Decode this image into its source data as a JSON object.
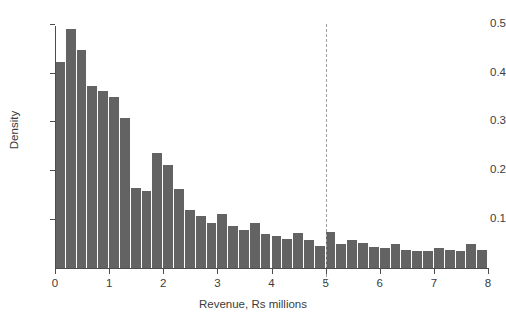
{
  "chart_data": {
    "type": "bar",
    "title": "",
    "subtitle": "",
    "xlabel": "Revenue, Rs millions",
    "ylabel": "Density",
    "xlim": [
      0,
      8
    ],
    "ylim": [
      0,
      0.52
    ],
    "bin_width": 0.2,
    "grid": false,
    "legend": null,
    "bar_color": "#636363",
    "axis_color": "#4d4d4d",
    "xticks": [
      0,
      1,
      2,
      3,
      4,
      5,
      6,
      7,
      8
    ],
    "xtick_labels": [
      "0",
      "1",
      "2",
      "3",
      "4",
      "5",
      "6",
      "7",
      "8"
    ],
    "yticks": [
      0.1,
      0.2,
      0.3,
      0.4,
      0.5
    ],
    "ytick_labels": [
      "0.1",
      "0.2",
      "0.3",
      "0.4",
      "0.5"
    ],
    "bin_starts": [
      0.0,
      0.2,
      0.4,
      0.6,
      0.8,
      1.0,
      1.2,
      1.4,
      1.6,
      1.8,
      2.0,
      2.2,
      2.4,
      2.6,
      2.8,
      3.0,
      3.2,
      3.4,
      3.6,
      3.8,
      4.0,
      4.2,
      4.4,
      4.6,
      4.8,
      5.0,
      5.2,
      5.4,
      5.6,
      5.8,
      6.0,
      6.2,
      6.4,
      6.6,
      6.8,
      7.0,
      7.2,
      7.4,
      7.6,
      7.8
    ],
    "categories": [
      "0.0-0.2",
      "0.2-0.4",
      "0.4-0.6",
      "0.6-0.8",
      "0.8-1.0",
      "1.0-1.2",
      "1.2-1.4",
      "1.4-1.6",
      "1.6-1.8",
      "1.8-2.0",
      "2.0-2.2",
      "2.2-2.4",
      "2.4-2.6",
      "2.6-2.8",
      "2.8-3.0",
      "3.0-3.2",
      "3.2-3.4",
      "3.4-3.6",
      "3.6-3.8",
      "3.8-4.0",
      "4.0-4.2",
      "4.2-4.4",
      "4.4-4.6",
      "4.6-4.8",
      "4.8-5.0",
      "5.0-5.2",
      "5.2-5.4",
      "5.4-5.6",
      "5.6-5.8",
      "5.8-6.0",
      "6.0-6.2",
      "6.2-6.4",
      "6.4-6.6",
      "6.6-6.8",
      "6.8-7.0",
      "7.0-7.2",
      "7.2-7.4",
      "7.4-7.6",
      "7.6-7.8",
      "7.8-8.0"
    ],
    "values": [
      0.422,
      0.49,
      0.446,
      0.373,
      0.362,
      0.35,
      0.308,
      0.164,
      0.157,
      0.236,
      0.21,
      0.162,
      0.119,
      0.106,
      0.093,
      0.111,
      0.086,
      0.078,
      0.092,
      0.069,
      0.065,
      0.06,
      0.072,
      0.057,
      0.046,
      0.073,
      0.05,
      0.057,
      0.052,
      0.044,
      0.042,
      0.05,
      0.037,
      0.034,
      0.034,
      0.04,
      0.037,
      0.034,
      0.05,
      0.037
    ],
    "annotations": [
      {
        "type": "vline",
        "x": 5,
        "style": "dashed",
        "color": "#a0a0a0",
        "label": ""
      }
    ]
  }
}
